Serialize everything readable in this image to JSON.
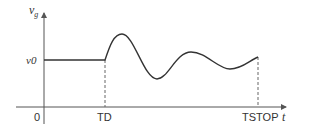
{
  "diagram": {
    "y_axis_label": "v",
    "y_axis_subscript": "g",
    "x_axis_label": "t",
    "origin_label": "0",
    "level_label": "v0",
    "td_label": "TD",
    "tstop_label": "TSTOP",
    "colors": {
      "line": "#333333",
      "axis": "#555555",
      "dashed": "#666666"
    }
  }
}
